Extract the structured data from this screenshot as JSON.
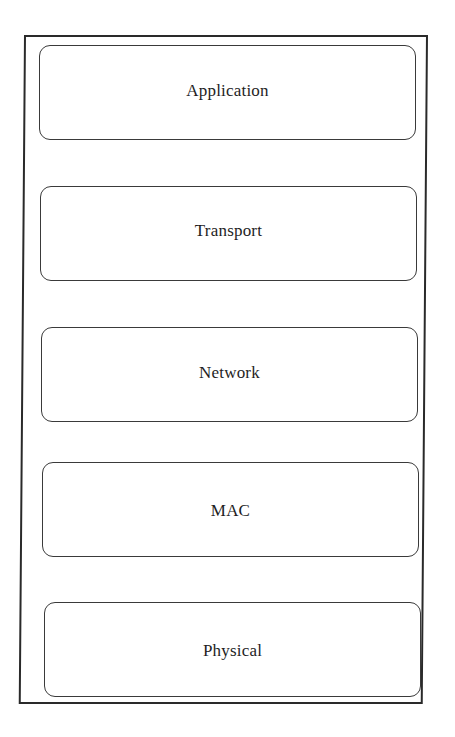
{
  "diagram": {
    "type": "protocol-stack",
    "layers": [
      {
        "label": "Application"
      },
      {
        "label": "Transport"
      },
      {
        "label": "Network"
      },
      {
        "label": "MAC"
      },
      {
        "label": "Physical"
      }
    ]
  }
}
